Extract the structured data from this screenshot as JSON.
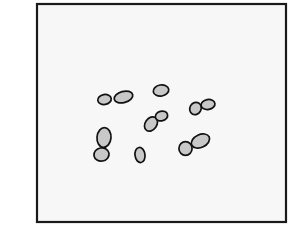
{
  "diagram": {
    "title": "",
    "colors": {
      "page_background": "#ffffff",
      "frame_background": "#f7f7f7",
      "frame_stroke": "#1a1a1a",
      "cell_fill": "#c8c8c8",
      "cell_stroke": "#111111"
    },
    "frame": {
      "x": 37,
      "y": 4,
      "width": 249,
      "height": 218,
      "stroke_width": 2.2
    },
    "cells": [
      {
        "id": "pair1-left",
        "cx": 104.5,
        "cy": 99.5,
        "rx": 6.8,
        "ry": 5.0,
        "rotate": -10
      },
      {
        "id": "pair1-right",
        "cx": 123.5,
        "cy": 97.0,
        "rx": 9.5,
        "ry": 5.6,
        "rotate": -15
      },
      {
        "id": "single-top",
        "cx": 161.0,
        "cy": 90.5,
        "rx": 7.8,
        "ry": 5.6,
        "rotate": -10
      },
      {
        "id": "center-lower",
        "cx": 151.0,
        "cy": 124.0,
        "rx": 5.8,
        "ry": 7.8,
        "rotate": 35
      },
      {
        "id": "center-upper",
        "cx": 161.5,
        "cy": 116.0,
        "rx": 6.2,
        "ry": 4.8,
        "rotate": -15
      },
      {
        "id": "right-left",
        "cx": 195.5,
        "cy": 108.5,
        "rx": 5.6,
        "ry": 6.4,
        "rotate": 30
      },
      {
        "id": "right-right",
        "cx": 208.0,
        "cy": 104.5,
        "rx": 7.0,
        "ry": 5.0,
        "rotate": -10
      },
      {
        "id": "vert-top",
        "cx": 104.0,
        "cy": 137.5,
        "rx": 7.0,
        "ry": 9.8,
        "rotate": 5
      },
      {
        "id": "vert-bottom",
        "cx": 101.5,
        "cy": 154.5,
        "rx": 7.6,
        "ry": 6.6,
        "rotate": -10
      },
      {
        "id": "small-single",
        "cx": 140.0,
        "cy": 155.0,
        "rx": 5.0,
        "ry": 7.6,
        "rotate": -8
      },
      {
        "id": "br-left",
        "cx": 185.5,
        "cy": 148.5,
        "rx": 6.6,
        "ry": 6.8,
        "rotate": 0
      },
      {
        "id": "br-right",
        "cx": 200.5,
        "cy": 141.0,
        "rx": 9.6,
        "ry": 6.4,
        "rotate": -25
      }
    ],
    "cell_stroke_width": 1.7
  }
}
